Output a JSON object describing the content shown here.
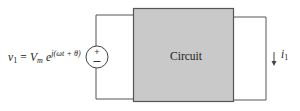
{
  "diagram": {
    "type": "circuit-schematic",
    "source": {
      "kind": "voltage-source",
      "polarity_top": "+",
      "polarity_bottom": "−"
    },
    "formula": {
      "var": "v",
      "var_sub": "1",
      "equals": "=",
      "amp": "V",
      "amp_sub": "m",
      "base": "e",
      "exponent": "j(ωt + θ)"
    },
    "block": {
      "label": "Circuit",
      "fill": "#c8c8c8",
      "stroke": "#555555"
    },
    "current": {
      "var": "i",
      "var_sub": "1",
      "direction": "down"
    },
    "wire_color": "#555555"
  }
}
